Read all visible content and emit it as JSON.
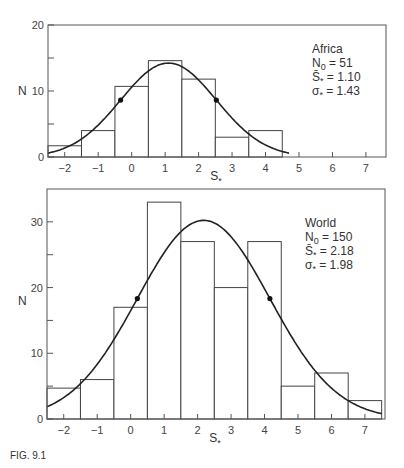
{
  "chart_data": [
    {
      "type": "bar",
      "title": "Africa",
      "xlabel": "S*",
      "ylabel": "N",
      "bin_width": 1,
      "categories": [
        -2,
        -1,
        0,
        1,
        2,
        3,
        4
      ],
      "values": [
        1.7,
        4,
        10.7,
        14.6,
        11.8,
        3,
        4
      ],
      "xlim": [
        -2.5,
        7.6
      ],
      "ylim": [
        0,
        20
      ],
      "x_ticks": [
        -2,
        -1,
        0,
        1,
        2,
        3,
        4,
        5,
        6,
        7
      ],
      "y_ticks": [
        0,
        10,
        20
      ],
      "y_minor_ticks": [
        5,
        15
      ],
      "fit": {
        "type": "gaussian",
        "mean": 1.1,
        "sigma": 1.43,
        "N0": 51
      },
      "marked_points": [
        {
          "x": -0.33,
          "y": 8.0
        },
        {
          "x": 2.53,
          "y": 8.3
        }
      ],
      "legend": {
        "name": "Africa",
        "lines": [
          "N0 = 51",
          "S̄* = 1.10",
          "σ* = 1.43"
        ]
      },
      "grid": false
    },
    {
      "type": "bar",
      "title": "World",
      "xlabel": "S*",
      "ylabel": "N",
      "bin_width": 1,
      "categories": [
        -2,
        -1,
        0,
        1,
        2,
        3,
        4,
        5,
        6,
        7
      ],
      "values": [
        4.7,
        6,
        17,
        33,
        27,
        20,
        27,
        5,
        7,
        2.8
      ],
      "xlim": [
        -2.5,
        7.6
      ],
      "ylim": [
        0,
        35
      ],
      "x_ticks": [
        -2,
        -1,
        0,
        1,
        2,
        3,
        4,
        5,
        6,
        7
      ],
      "y_ticks": [
        0,
        10,
        20,
        30
      ],
      "y_minor_ticks": [
        5,
        15,
        25
      ],
      "fit": {
        "type": "gaussian",
        "mean": 2.18,
        "sigma": 1.98,
        "N0": 150
      },
      "marked_points": [
        {
          "x": 0.2,
          "y": 18.2
        },
        {
          "x": 4.16,
          "y": 18.2
        }
      ],
      "legend": {
        "name": "World",
        "lines": [
          "N0 = 150",
          "S̄* = 2.18",
          "σ* = 1.98"
        ]
      },
      "grid": false
    }
  ],
  "caption": "FIG. 9.1",
  "panels": [
    {
      "ylabel": "N",
      "xlabel_main": "S",
      "xlabel_sub": "*",
      "legend": {
        "name": "Africa",
        "n0_main": "N",
        "n0_sub": "0",
        "n0_val": " = 51",
        "mean_main": "S̄",
        "mean_sub": "*",
        "mean_val": " = 1.10",
        "sigma_main": "σ",
        "sigma_sub": "*",
        "sigma_val": " = 1.43"
      }
    },
    {
      "ylabel": "N",
      "xlabel_main": "S",
      "xlabel_sub": "*",
      "legend": {
        "name": "World",
        "n0_main": "N",
        "n0_sub": "0",
        "n0_val": " = 150",
        "mean_main": "S̄",
        "mean_sub": "*",
        "mean_val": " = 2.18",
        "sigma_main": "σ",
        "sigma_sub": "*",
        "sigma_val": " = 1.98"
      }
    }
  ],
  "style": {
    "line_color": "#333333",
    "bar_stroke": "#444444",
    "background": "#ffffff"
  }
}
